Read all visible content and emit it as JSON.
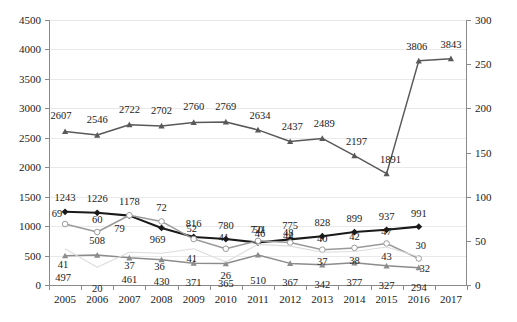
{
  "chart_data": {
    "type": "line",
    "title": "",
    "xlabel": "",
    "ylabel": "",
    "grid": true,
    "legend": "none",
    "categories": [
      "2005",
      "2006",
      "2007",
      "2008",
      "2009",
      "2010",
      "2011",
      "2012",
      "2013",
      "2014",
      "2015",
      "2016",
      "2017"
    ],
    "primary_axis": {
      "label": "",
      "ylim": [
        0,
        4500
      ],
      "ticks": [
        0,
        500,
        1000,
        1500,
        2000,
        2500,
        3000,
        3500,
        4000,
        4500
      ]
    },
    "secondary_axis": {
      "label": "",
      "ylim": [
        0,
        300
      ],
      "ticks": [
        0,
        50,
        100,
        150,
        200,
        250,
        300
      ]
    },
    "series": [
      {
        "name": "series-top-grey",
        "axis": "primary",
        "marker": "triangle",
        "color": "#595959",
        "x": [
          "2005",
          "2006",
          "2007",
          "2008",
          "2009",
          "2010",
          "2011",
          "2012",
          "2013",
          "2014",
          "2015",
          "2016",
          "2017"
        ],
        "values": [
          2607,
          2546,
          2722,
          2702,
          2760,
          2769,
          2634,
          2437,
          2489,
          2197,
          1891,
          3806,
          3843
        ]
      },
      {
        "name": "series-black-diamond",
        "axis": "primary",
        "marker": "diamond",
        "color": "#1a1a1a",
        "x": [
          "2005",
          "2006",
          "2007",
          "2008",
          "2009",
          "2010",
          "2011",
          "2012",
          "2013",
          "2014",
          "2015",
          "2016"
        ],
        "values": [
          1243,
          1226,
          1178,
          969,
          816,
          780,
          721,
          775,
          828,
          899,
          937,
          991
        ]
      },
      {
        "name": "series-open-circle",
        "axis": "secondary",
        "marker": "open-circle",
        "color": "#9a9a9a",
        "x": [
          "2005",
          "2006",
          "2007",
          "2008",
          "2009",
          "2010",
          "2011",
          "2012",
          "2013",
          "2014",
          "2015",
          "2016"
        ],
        "values": [
          69,
          60,
          79,
          72,
          52,
          41,
          50,
          48,
          40,
          42,
          47,
          30
        ]
      },
      {
        "name": "series-mid-grey-triangle",
        "axis": "primary",
        "marker": "triangle",
        "color": "#8c8c8c",
        "x": [
          "2005",
          "2006",
          "2007",
          "2008",
          "2009",
          "2010",
          "2011",
          "2012",
          "2013",
          "2014",
          "2015",
          "2016"
        ],
        "values": [
          497,
          508,
          461,
          430,
          371,
          365,
          510,
          367,
          342,
          377,
          327,
          294
        ]
      },
      {
        "name": "series-faint-light",
        "axis": "secondary",
        "marker": "none",
        "color": "#dcdcdc",
        "x": [
          "2005",
          "2006",
          "2007",
          "2008",
          "2009",
          "2010",
          "2011",
          "2012",
          "2013",
          "2014",
          "2015",
          "2016"
        ],
        "values": [
          41,
          20,
          37,
          36,
          41,
          26,
          46,
          44,
          37,
          38,
          43,
          32
        ]
      }
    ],
    "data_labels": [
      {
        "text": "2607",
        "x": 2005,
        "series": "series-top-grey",
        "dx": -4,
        "dy": -15
      },
      {
        "text": "2546",
        "x": 2006,
        "series": "series-top-grey",
        "dx": 0,
        "dy": -15
      },
      {
        "text": "2722",
        "x": 2007,
        "series": "series-top-grey",
        "dx": 0,
        "dy": -15
      },
      {
        "text": "2702",
        "x": 2008,
        "series": "series-top-grey",
        "dx": 0,
        "dy": -15
      },
      {
        "text": "2760",
        "x": 2009,
        "series": "series-top-grey",
        "dx": 0,
        "dy": -15
      },
      {
        "text": "2769",
        "x": 2010,
        "series": "series-top-grey",
        "dx": 0,
        "dy": -15
      },
      {
        "text": "2634",
        "x": 2011,
        "series": "series-top-grey",
        "dx": 2,
        "dy": -14
      },
      {
        "text": "2437",
        "x": 2012,
        "series": "series-top-grey",
        "dx": 2,
        "dy": -14
      },
      {
        "text": "2489",
        "x": 2013,
        "series": "series-top-grey",
        "dx": 2,
        "dy": -14
      },
      {
        "text": "2197",
        "x": 2014,
        "series": "series-top-grey",
        "dx": 2,
        "dy": -14
      },
      {
        "text": "1891",
        "x": 2015,
        "series": "series-top-grey",
        "dx": 4,
        "dy": -14
      },
      {
        "text": "3806",
        "x": 2016,
        "series": "series-top-grey",
        "dx": -2,
        "dy": -14
      },
      {
        "text": "3843",
        "x": 2017,
        "series": "series-top-grey",
        "dx": 0,
        "dy": -14
      },
      {
        "text": "1243",
        "x": 2005,
        "series": "series-black-diamond",
        "dx": 0,
        "dy": -14
      },
      {
        "text": "1226",
        "x": 2006,
        "series": "series-black-diamond",
        "dx": 0,
        "dy": -14
      },
      {
        "text": "1178",
        "x": 2007,
        "series": "series-black-diamond",
        "dx": 0,
        "dy": -14
      },
      {
        "text": "969",
        "x": 2008,
        "series": "series-black-diamond",
        "dx": -4,
        "dy": 12
      },
      {
        "text": "816",
        "x": 2009,
        "series": "series-black-diamond",
        "dx": 0,
        "dy": -13
      },
      {
        "text": "780",
        "x": 2010,
        "series": "series-black-diamond",
        "dx": 0,
        "dy": -13
      },
      {
        "text": "721",
        "x": 2011,
        "series": "series-black-diamond",
        "dx": 0,
        "dy": -13
      },
      {
        "text": "775",
        "x": 2012,
        "series": "series-black-diamond",
        "dx": 0,
        "dy": -13
      },
      {
        "text": "828",
        "x": 2013,
        "series": "series-black-diamond",
        "dx": 0,
        "dy": -13
      },
      {
        "text": "899",
        "x": 2014,
        "series": "series-black-diamond",
        "dx": 0,
        "dy": -13
      },
      {
        "text": "937",
        "x": 2015,
        "series": "series-black-diamond",
        "dx": 0,
        "dy": -13
      },
      {
        "text": "991",
        "x": 2016,
        "series": "series-black-diamond",
        "dx": 0,
        "dy": -13
      },
      {
        "text": "69",
        "x": 2005,
        "series": "series-open-circle",
        "dx": -8,
        "dy": -10
      },
      {
        "text": "60",
        "x": 2006,
        "series": "series-open-circle",
        "dx": 0,
        "dy": -12
      },
      {
        "text": "79",
        "x": 2007,
        "series": "series-open-circle",
        "dx": -10,
        "dy": 14
      },
      {
        "text": "72",
        "x": 2008,
        "series": "series-open-circle",
        "dx": 0,
        "dy": -13
      },
      {
        "text": "52",
        "x": 2009,
        "series": "series-open-circle",
        "dx": -2,
        "dy": -10
      },
      {
        "text": "41",
        "x": 2010,
        "series": "series-open-circle",
        "dx": -2,
        "dy": -11
      },
      {
        "text": "50",
        "x": 2011,
        "series": "series-open-circle",
        "dx": 0,
        "dy": -11
      },
      {
        "text": "48",
        "x": 2012,
        "series": "series-open-circle",
        "dx": -2,
        "dy": -10
      },
      {
        "text": "40",
        "x": 2013,
        "series": "series-open-circle",
        "dx": 0,
        "dy": -11
      },
      {
        "text": "42",
        "x": 2014,
        "series": "series-open-circle",
        "dx": 0,
        "dy": -11
      },
      {
        "text": "47",
        "x": 2015,
        "series": "series-open-circle",
        "dx": 0,
        "dy": -11
      },
      {
        "text": "30",
        "x": 2016,
        "series": "series-open-circle",
        "dx": 2,
        "dy": -13
      },
      {
        "text": "497",
        "x": 2005,
        "series": "series-mid-grey-triangle",
        "dx": -2,
        "dy": 22
      },
      {
        "text": "508",
        "x": 2006,
        "series": "series-mid-grey-triangle",
        "dx": 0,
        "dy": -14
      },
      {
        "text": "461",
        "x": 2007,
        "series": "series-mid-grey-triangle",
        "dx": 0,
        "dy": 22
      },
      {
        "text": "430",
        "x": 2008,
        "series": "series-mid-grey-triangle",
        "dx": 0,
        "dy": 22
      },
      {
        "text": "371",
        "x": 2009,
        "series": "series-mid-grey-triangle",
        "dx": 0,
        "dy": 20
      },
      {
        "text": "365",
        "x": 2010,
        "series": "series-mid-grey-triangle",
        "dx": 0,
        "dy": 20
      },
      {
        "text": "510",
        "x": 2011,
        "series": "series-mid-grey-triangle",
        "dx": 0,
        "dy": 26
      },
      {
        "text": "367",
        "x": 2012,
        "series": "series-mid-grey-triangle",
        "dx": 0,
        "dy": 20
      },
      {
        "text": "342",
        "x": 2013,
        "series": "series-mid-grey-triangle",
        "dx": 0,
        "dy": 20
      },
      {
        "text": "377",
        "x": 2014,
        "series": "series-mid-grey-triangle",
        "dx": 0,
        "dy": 20
      },
      {
        "text": "327",
        "x": 2015,
        "series": "series-mid-grey-triangle",
        "dx": 0,
        "dy": 20
      },
      {
        "text": "294",
        "x": 2016,
        "series": "series-mid-grey-triangle",
        "dx": 0,
        "dy": 20
      },
      {
        "text": "41",
        "x": 2005,
        "series": "series-faint-light",
        "dx": -2,
        "dy": 16
      },
      {
        "text": "20",
        "x": 2006,
        "series": "series-faint-light",
        "dx": 0,
        "dy": 22
      },
      {
        "text": "37",
        "x": 2007,
        "series": "series-faint-light",
        "dx": 0,
        "dy": 14
      },
      {
        "text": "36",
        "x": 2008,
        "series": "series-faint-light",
        "dx": -2,
        "dy": 14
      },
      {
        "text": "41",
        "x": 2009,
        "series": "series-faint-light",
        "dx": -2,
        "dy": 10
      },
      {
        "text": "26",
        "x": 2010,
        "series": "series-faint-light",
        "dx": 0,
        "dy": 14
      },
      {
        "text": "46",
        "x": 2011,
        "series": "series-faint-light",
        "dx": 2,
        "dy": -10
      },
      {
        "text": "44",
        "x": 2012,
        "series": "series-faint-light",
        "dx": -2,
        "dy": -10
      },
      {
        "text": "37",
        "x": 2013,
        "series": "series-faint-light",
        "dx": 0,
        "dy": 10
      },
      {
        "text": "38",
        "x": 2014,
        "series": "series-faint-light",
        "dx": 0,
        "dy": 10
      },
      {
        "text": "43",
        "x": 2015,
        "series": "series-faint-light",
        "dx": 0,
        "dy": 10
      },
      {
        "text": "32",
        "x": 2016,
        "series": "series-faint-light",
        "dx": 6,
        "dy": 12
      }
    ]
  }
}
